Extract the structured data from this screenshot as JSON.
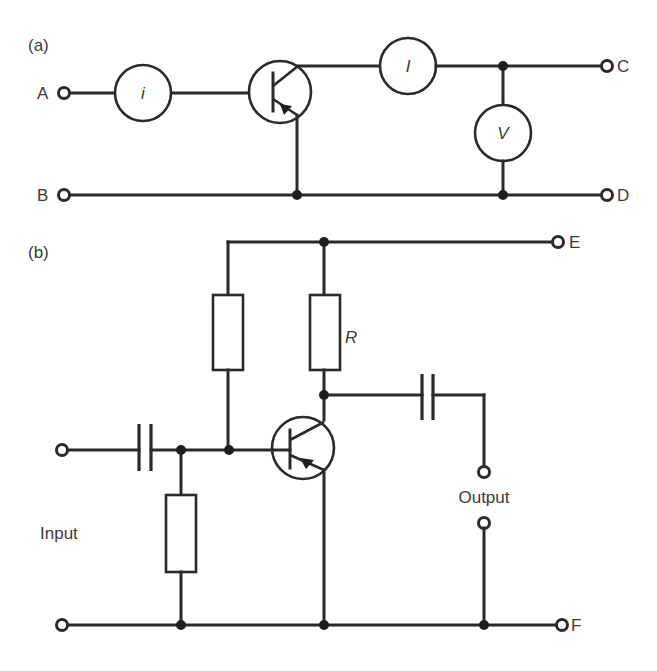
{
  "figure": {
    "panel_a": {
      "label": "(a)",
      "terminals": {
        "A": "A",
        "B": "B",
        "C": "C",
        "D": "D"
      },
      "meters": {
        "input_current": "i",
        "output_current": "I",
        "output_voltage": "V"
      },
      "transistor": "pnp-transistor"
    },
    "panel_b": {
      "label": "(b)",
      "terminals": {
        "E": "E",
        "F": "F"
      },
      "resistor_label": "R",
      "input_label": "Input",
      "output_label": "Output",
      "transistor": "pnp-transistor"
    }
  }
}
